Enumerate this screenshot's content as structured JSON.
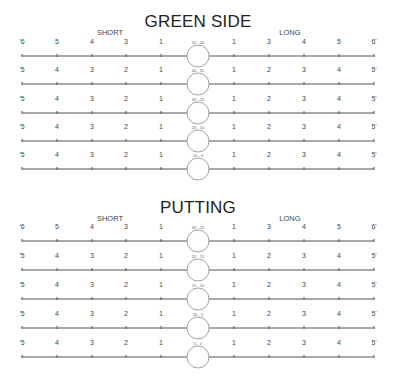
{
  "sections": [
    {
      "title": "GREEN SIDE",
      "title_y": 12,
      "labels": {
        "short": "SHORT",
        "long": "LONG",
        "y": 28
      },
      "rows": [
        {
          "y": 56,
          "range": "50 - 40",
          "left": [
            "'6",
            "5",
            "4",
            "3",
            "1"
          ],
          "right": [
            "1",
            "3",
            "4",
            "5",
            "6'"
          ]
        },
        {
          "y": 84,
          "range": "40 - 31",
          "left": [
            "'5",
            "4",
            "3",
            "2",
            "1"
          ],
          "right": [
            "1",
            "2",
            "3",
            "4",
            "5'"
          ]
        },
        {
          "y": 113,
          "range": "30 - 20",
          "left": [
            "'5",
            "4",
            "3",
            "2",
            "1"
          ],
          "right": [
            "1",
            "2",
            "3",
            "4",
            "5'"
          ]
        },
        {
          "y": 141,
          "range": "20 - 10",
          "left": [
            "'5",
            "4",
            "3",
            "2",
            "1"
          ],
          "right": [
            "1",
            "2",
            "3",
            "4",
            "5'"
          ]
        },
        {
          "y": 169,
          "range": "10 - 0",
          "left": [
            "'5",
            "4",
            "3",
            "2",
            "1"
          ],
          "right": [
            "1",
            "2",
            "3",
            "4",
            "5'"
          ]
        }
      ]
    },
    {
      "title": "PUTTING",
      "title_y": 198,
      "labels": {
        "short": "SHORT",
        "long": "LONG",
        "y": 214
      },
      "rows": [
        {
          "y": 241,
          "range": "30 - 25",
          "left": [
            "'6",
            "5",
            "4",
            "3",
            "1"
          ],
          "right": [
            "1",
            "3",
            "4",
            "5",
            "6'"
          ]
        },
        {
          "y": 270,
          "range": "20 - 15",
          "left": [
            "'5",
            "4",
            "3",
            "2",
            "1"
          ],
          "right": [
            "1",
            "2",
            "3",
            "4",
            "5'"
          ]
        },
        {
          "y": 299,
          "range": "15 - 10",
          "left": [
            "'5",
            "4",
            "3",
            "2",
            "1"
          ],
          "right": [
            "1",
            "2",
            "3",
            "4",
            "5'"
          ]
        },
        {
          "y": 328,
          "range": "10 - 5",
          "left": [
            "'5",
            "4",
            "3",
            "2",
            "1"
          ],
          "right": [
            "1",
            "2",
            "3",
            "4",
            "5'"
          ]
        },
        {
          "y": 357,
          "range": "5 - 0",
          "left": [
            "'5",
            "4",
            "3",
            "2",
            "1"
          ],
          "right": [
            "1",
            "2",
            "3",
            "4",
            "5'"
          ]
        }
      ]
    }
  ],
  "geometry": {
    "left_ticks_x": [
      22,
      57,
      92,
      126,
      161
    ],
    "right_ticks_x": [
      234,
      269,
      304,
      339,
      374
    ],
    "circle_cx": 198,
    "circle_r": 11,
    "short_label_x": 110,
    "long_label_x": 290
  },
  "colors": {
    "line": "#555555",
    "circle": "#888888",
    "text": "#333333"
  }
}
